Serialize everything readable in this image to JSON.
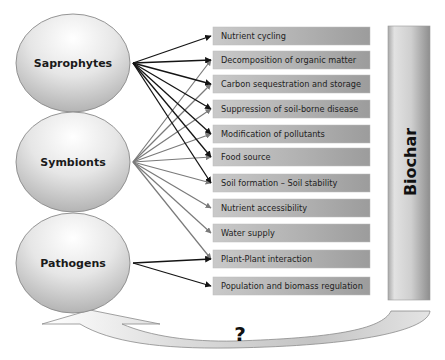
{
  "organisms": [
    {
      "id": "saprophytes",
      "label": "Saprophytes",
      "cx": 73,
      "cy": 63,
      "rx": 57,
      "ry": 49,
      "arrow_color": "#141414"
    },
    {
      "id": "symbionts",
      "label": "Symbionts",
      "cx": 73,
      "cy": 162,
      "rx": 57,
      "ry": 50,
      "arrow_color": "#7a7a7a"
    },
    {
      "id": "pathogens",
      "label": "Pathogens",
      "cx": 73,
      "cy": 263,
      "rx": 57,
      "ry": 50,
      "arrow_color": "#141414"
    }
  ],
  "functions": [
    {
      "id": "nutrient-cycling",
      "label": "Nutrient cycling",
      "y": 27
    },
    {
      "id": "decomposition",
      "label": "Decomposition of organic matter",
      "y": 51
    },
    {
      "id": "carbon-sequestration",
      "label": "Carbon sequestration and storage",
      "y": 75
    },
    {
      "id": "suppression",
      "label": "Suppression of soil-borne disease",
      "y": 100
    },
    {
      "id": "modification-pollutants",
      "label": "Modification of pollutants",
      "y": 125
    },
    {
      "id": "food-source",
      "label": "Food source",
      "y": 148
    },
    {
      "id": "soil-formation",
      "label": "Soil formation – Soil stability",
      "y": 174
    },
    {
      "id": "nutrient-accessibility",
      "label": "Nutrient accessibility",
      "y": 199
    },
    {
      "id": "water-supply",
      "label": "Water supply",
      "y": 224
    },
    {
      "id": "plant-plant",
      "label": "Plant-Plant interaction",
      "y": 250
    },
    {
      "id": "population-regulation",
      "label": "Population and biomass regulation",
      "y": 277
    }
  ],
  "links": {
    "saprophytes": [
      "nutrient-cycling",
      "decomposition",
      "carbon-sequestration",
      "suppression",
      "modification-pollutants",
      "food-source",
      "soil-formation"
    ],
    "symbionts": [
      "decomposition",
      "carbon-sequestration",
      "suppression",
      "modification-pollutants",
      "food-source",
      "soil-formation",
      "nutrient-accessibility",
      "water-supply",
      "plant-plant"
    ],
    "pathogens": [
      "plant-plant",
      "population-regulation"
    ]
  },
  "biochar": {
    "label": "Biochar"
  },
  "feedback": {
    "label": "?"
  },
  "colors": {
    "box_light": "#c8c8c8",
    "box_dark": "#9a9a9a",
    "circle_light": "#ffffff",
    "circle_dark": "#a8a8a8",
    "outline": "#8a8a8a"
  }
}
